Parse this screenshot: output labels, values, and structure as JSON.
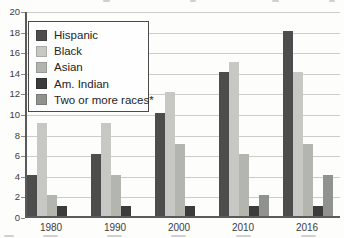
{
  "chart_data": {
    "type": "bar",
    "categories": [
      "1980",
      "1990",
      "2000",
      "2010",
      "2016"
    ],
    "series": [
      {
        "name": "Hispanic",
        "color": "#4d4d4d",
        "values": [
          4,
          6,
          10,
          14,
          18
        ]
      },
      {
        "name": "Black",
        "color": "#c7c8c3",
        "values": [
          9,
          9,
          12,
          15,
          14
        ]
      },
      {
        "name": "Asian",
        "color": "#b3b5af",
        "values": [
          2,
          4,
          7,
          6,
          7
        ]
      },
      {
        "name": "Am. Indian",
        "color": "#3b3b3b",
        "values": [
          1,
          1,
          1,
          1,
          1
        ]
      },
      {
        "name": "Two or more races*",
        "color": "#90928e",
        "values": [
          null,
          null,
          null,
          2,
          4
        ]
      }
    ],
    "title": "",
    "xlabel": "",
    "ylabel": "",
    "ylim": [
      0,
      20
    ],
    "ytick_step": 2,
    "y_tick_labels": [
      "0",
      "2",
      "4",
      "6",
      "8",
      "10",
      "12",
      "14",
      "16",
      "18",
      "20"
    ],
    "grid": true,
    "legend_position": "top-left",
    "colors": {
      "gridline": "#cccccc",
      "axis": "#5a5a5a",
      "text": "#3c3c3c",
      "background": "#fdfdfc",
      "legend_border": "#4a4a4a"
    }
  }
}
